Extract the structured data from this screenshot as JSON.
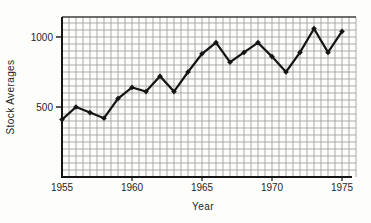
{
  "figure": {
    "background": "#fdfdfb"
  },
  "chart_data": {
    "type": "line",
    "title": "",
    "xlabel": "Year",
    "ylabel": "Stock Averages",
    "x": [
      1955,
      1956,
      1957,
      1958,
      1959,
      1960,
      1961,
      1962,
      1963,
      1964,
      1965,
      1966,
      1967,
      1968,
      1969,
      1970,
      1971,
      1972,
      1973,
      1974,
      1975
    ],
    "values": [
      410,
      500,
      460,
      420,
      560,
      640,
      610,
      720,
      610,
      750,
      880,
      960,
      820,
      890,
      960,
      860,
      750,
      890,
      1060,
      890,
      1040
    ],
    "x_ticks": [
      {
        "value": 1955,
        "label": "1955"
      },
      {
        "value": 1960,
        "label": "1960"
      },
      {
        "value": 1965,
        "label": "1965"
      },
      {
        "value": 1970,
        "label": "1970"
      },
      {
        "value": 1975,
        "label": "1975"
      }
    ],
    "y_ticks": [
      {
        "value": 500,
        "label": "500"
      },
      {
        "value": 1000,
        "label": "1000"
      }
    ],
    "xlim": [
      1955,
      1975
    ],
    "ylim": [
      0,
      1140
    ],
    "grid": "fine graph-paper grid, minor cell = 0.5 year x 50 units",
    "legend": "none",
    "marker": "filled-diamond",
    "colors": {
      "line": "#151515",
      "axis": "#151515",
      "grid": "#9d9d9d",
      "text": "#1f1f1f"
    }
  }
}
